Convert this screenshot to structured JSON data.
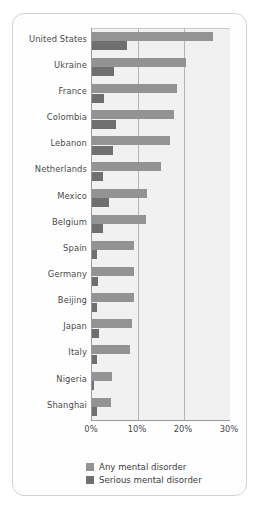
{
  "chart_data": {
    "type": "bar",
    "orientation": "horizontal",
    "title": "",
    "xlabel": "",
    "ylabel": "",
    "xlim": [
      0,
      30
    ],
    "grid": true,
    "legend_position": "bottom",
    "tick_labels": [
      "0%",
      "10%",
      "20%",
      "30%"
    ],
    "tick_values": [
      0,
      10,
      20,
      30
    ],
    "categories": [
      "United States",
      "Ukraine",
      "France",
      "Colombia",
      "Lebanon",
      "Netherlands",
      "Mexico",
      "Belgium",
      "Spain",
      "Germany",
      "Beijing",
      "Japan",
      "Italy",
      "Nigeria",
      "Shanghai"
    ],
    "series": [
      {
        "name": "Any mental disorder",
        "color": "#939393",
        "values": [
          26.3,
          20.4,
          18.5,
          17.8,
          16.9,
          14.9,
          12.0,
          11.7,
          9.2,
          9.1,
          9.1,
          8.8,
          8.2,
          4.4,
          4.2
        ]
      },
      {
        "name": "Serious mental disorder",
        "color": "#6f6f6f",
        "values": [
          7.7,
          4.8,
          2.7,
          5.2,
          4.6,
          2.3,
          3.6,
          2.4,
          1.0,
          1.2,
          1.0,
          1.5,
          1.0,
          0.4,
          1.1
        ]
      }
    ]
  },
  "legend": {
    "items": [
      {
        "label": "Any mental disorder"
      },
      {
        "label": "Serious mental disorder"
      }
    ]
  }
}
